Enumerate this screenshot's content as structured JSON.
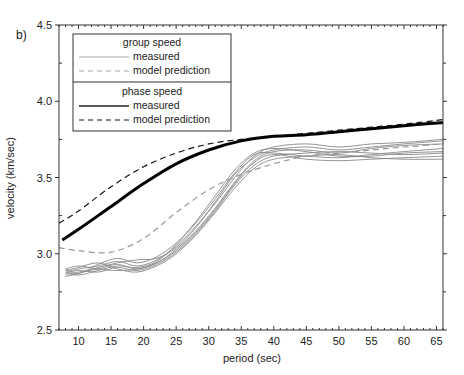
{
  "panel_label": "b)",
  "chart_data": {
    "type": "line",
    "title": "",
    "xlabel": "period (sec)",
    "ylabel": "velocity (km/sec)",
    "xlim": [
      7,
      66
    ],
    "ylim": [
      2.5,
      4.5
    ],
    "x_ticks": [
      10,
      15,
      20,
      25,
      30,
      35,
      40,
      45,
      50,
      55,
      60,
      65
    ],
    "y_ticks": [
      2.5,
      3.0,
      3.5,
      4.0,
      4.5
    ],
    "y_tick_labels": [
      "2.5",
      "3.0",
      "3.5",
      "4.0",
      "4.5"
    ],
    "grid": false,
    "legend": {
      "position": "upper left",
      "sections": [
        {
          "title": "group speed",
          "entries": [
            {
              "label": "measured",
              "style": "solid-grey"
            },
            {
              "label": "model prediction",
              "style": "dashed-grey"
            }
          ]
        },
        {
          "title": "phase speed",
          "entries": [
            {
              "label": "measured",
              "style": "solid-black"
            },
            {
              "label": "model prediction",
              "style": "dashed-black"
            }
          ]
        }
      ]
    },
    "series": [
      {
        "name": "phase speed model prediction",
        "color": "#111111",
        "dash": "6,4",
        "width": 1.2,
        "x": [
          7,
          10,
          15,
          20,
          25,
          30,
          35,
          40,
          45,
          50,
          55,
          60,
          66
        ],
        "y": [
          3.2,
          3.28,
          3.44,
          3.57,
          3.66,
          3.72,
          3.75,
          3.77,
          3.79,
          3.81,
          3.83,
          3.85,
          3.88
        ]
      },
      {
        "name": "phase speed measured",
        "color": "#000000",
        "dash": "",
        "width": 3,
        "x": [
          7.5,
          10,
          15,
          20,
          25,
          30,
          35,
          40,
          45,
          50,
          55,
          60,
          66
        ],
        "y": [
          3.09,
          3.16,
          3.31,
          3.46,
          3.59,
          3.68,
          3.74,
          3.77,
          3.78,
          3.8,
          3.82,
          3.84,
          3.86
        ]
      },
      {
        "name": "group speed model prediction",
        "color": "#999999",
        "dash": "6,4",
        "width": 1.2,
        "x": [
          7,
          10,
          15,
          20,
          25,
          30,
          35,
          40,
          45,
          50,
          55,
          60,
          66
        ],
        "y": [
          3.04,
          3.02,
          3.01,
          3.1,
          3.27,
          3.42,
          3.52,
          3.59,
          3.64,
          3.66,
          3.68,
          3.7,
          3.72
        ]
      },
      {
        "name": "group speed measured 1",
        "color": "#888888",
        "dash": "",
        "width": 0.9,
        "x": [
          8,
          10,
          13,
          16,
          19,
          22,
          25,
          28,
          31,
          34,
          37,
          40,
          45,
          50,
          55,
          60,
          66
        ],
        "y": [
          2.88,
          2.9,
          2.92,
          2.95,
          2.92,
          2.96,
          3.05,
          3.18,
          3.33,
          3.5,
          3.64,
          3.7,
          3.72,
          3.7,
          3.72,
          3.73,
          3.75
        ]
      },
      {
        "name": "group speed measured 2",
        "color": "#888888",
        "dash": "",
        "width": 0.9,
        "x": [
          8,
          10,
          13,
          16,
          19,
          22,
          25,
          28,
          31,
          34,
          37,
          40,
          45,
          50,
          55,
          60,
          66
        ],
        "y": [
          2.86,
          2.88,
          2.9,
          2.93,
          2.9,
          2.94,
          3.03,
          3.15,
          3.3,
          3.47,
          3.61,
          3.67,
          3.68,
          3.66,
          3.69,
          3.71,
          3.72
        ]
      },
      {
        "name": "group speed measured 3",
        "color": "#888888",
        "dash": "",
        "width": 0.9,
        "x": [
          8,
          10,
          13,
          16,
          19,
          22,
          25,
          28,
          31,
          34,
          37,
          40,
          45,
          50,
          55,
          60,
          66
        ],
        "y": [
          2.9,
          2.87,
          2.93,
          2.97,
          2.94,
          2.98,
          3.07,
          3.2,
          3.36,
          3.53,
          3.65,
          3.66,
          3.64,
          3.63,
          3.65,
          3.67,
          3.69
        ]
      },
      {
        "name": "group speed measured 4",
        "color": "#888888",
        "dash": "",
        "width": 0.9,
        "x": [
          8,
          10,
          13,
          16,
          19,
          22,
          25,
          28,
          31,
          34,
          37,
          40,
          45,
          50,
          55,
          60,
          66
        ],
        "y": [
          2.87,
          2.89,
          2.88,
          2.91,
          2.89,
          2.93,
          3.01,
          3.13,
          3.28,
          3.45,
          3.58,
          3.64,
          3.66,
          3.67,
          3.66,
          3.65,
          3.66
        ]
      },
      {
        "name": "group speed measured 5",
        "color": "#888888",
        "dash": "",
        "width": 0.9,
        "x": [
          8,
          10,
          13,
          16,
          19,
          22,
          25,
          28,
          31,
          34,
          37,
          40,
          45,
          50,
          55,
          60,
          66
        ],
        "y": [
          2.89,
          2.91,
          2.94,
          2.9,
          2.88,
          2.92,
          3.0,
          3.12,
          3.27,
          3.43,
          3.56,
          3.62,
          3.64,
          3.65,
          3.63,
          3.62,
          3.62
        ]
      },
      {
        "name": "group speed measured 6",
        "color": "#888888",
        "dash": "",
        "width": 0.9,
        "x": [
          8,
          10,
          13,
          16,
          19,
          22,
          25,
          28,
          31,
          34,
          37,
          40,
          45,
          50,
          55,
          60,
          66
        ],
        "y": [
          2.85,
          2.87,
          2.91,
          2.94,
          2.96,
          2.97,
          3.04,
          3.17,
          3.34,
          3.52,
          3.63,
          3.68,
          3.7,
          3.68,
          3.7,
          3.72,
          3.74
        ]
      },
      {
        "name": "group speed measured 7",
        "color": "#888888",
        "dash": "",
        "width": 0.9,
        "x": [
          8,
          10,
          13,
          16,
          19,
          22,
          25,
          28,
          31,
          34,
          37,
          40,
          45,
          50,
          55,
          60,
          66
        ],
        "y": [
          2.88,
          2.86,
          2.89,
          2.92,
          2.91,
          2.95,
          3.06,
          3.21,
          3.38,
          3.55,
          3.66,
          3.69,
          3.67,
          3.64,
          3.64,
          3.66,
          3.67
        ]
      },
      {
        "name": "group speed measured 8",
        "color": "#888888",
        "dash": "",
        "width": 0.9,
        "x": [
          8,
          10,
          13,
          16,
          19,
          22,
          25,
          28,
          31,
          34,
          37,
          40,
          45,
          50,
          55,
          60,
          66
        ],
        "y": [
          2.9,
          2.92,
          2.9,
          2.89,
          2.9,
          2.94,
          3.02,
          3.14,
          3.29,
          3.46,
          3.6,
          3.65,
          3.62,
          3.61,
          3.62,
          3.63,
          3.64
        ]
      }
    ]
  }
}
